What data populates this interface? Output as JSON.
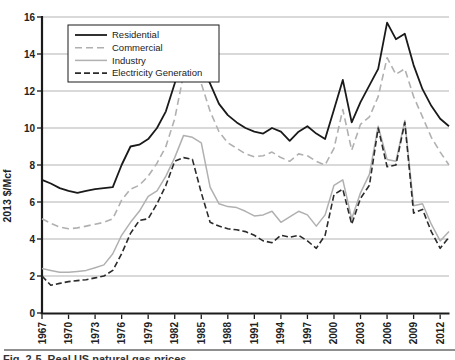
{
  "figure": {
    "caption_partial": "Fig. 2-5. Real US natural gas prices"
  },
  "chart_data": {
    "type": "line",
    "title": "",
    "xlabel": "",
    "ylabel": "2013 $/Mcf",
    "ylim": [
      0,
      16
    ],
    "ytick_step": 2,
    "ytick_values": [
      0,
      2,
      4,
      6,
      8,
      10,
      12,
      14,
      16
    ],
    "x_start": 1967,
    "x_end": 2013,
    "xtick_years": [
      1967,
      1970,
      1973,
      1976,
      1979,
      1982,
      1985,
      1988,
      1991,
      1994,
      1997,
      2000,
      2003,
      2006,
      2009,
      2012
    ],
    "grid": "horizontal-only",
    "gridline_color": "#b3b3b3",
    "axis_color": "#1a1a1a",
    "legend_position": "top-left",
    "years": [
      1967,
      1968,
      1969,
      1970,
      1971,
      1972,
      1973,
      1974,
      1975,
      1976,
      1977,
      1978,
      1979,
      1980,
      1981,
      1982,
      1983,
      1984,
      1985,
      1986,
      1987,
      1988,
      1989,
      1990,
      1991,
      1992,
      1993,
      1994,
      1995,
      1996,
      1997,
      1998,
      1999,
      2000,
      2001,
      2002,
      2003,
      2004,
      2005,
      2006,
      2007,
      2008,
      2009,
      2010,
      2011,
      2012,
      2013
    ],
    "series": [
      {
        "name": "Residential",
        "style": "solid",
        "color": "#1a1a1a",
        "width": 1.8,
        "dash": "",
        "values": [
          7.2,
          7.0,
          6.75,
          6.6,
          6.5,
          6.6,
          6.7,
          6.75,
          6.8,
          8.0,
          9.0,
          9.1,
          9.4,
          10.0,
          10.9,
          12.4,
          14.1,
          13.9,
          13.4,
          12.4,
          11.3,
          10.7,
          10.3,
          10.0,
          9.8,
          9.7,
          10.0,
          9.8,
          9.3,
          9.8,
          10.1,
          9.7,
          9.4,
          11.0,
          12.6,
          10.3,
          11.4,
          12.3,
          13.2,
          15.7,
          14.8,
          15.1,
          13.4,
          12.1,
          11.2,
          10.5,
          10.1
        ]
      },
      {
        "name": "Commercial",
        "style": "dashed",
        "color": "#b0b0b0",
        "width": 1.6,
        "dash": "7,4",
        "values": [
          5.1,
          4.85,
          4.65,
          4.55,
          4.6,
          4.7,
          4.8,
          4.9,
          5.1,
          6.1,
          6.7,
          6.9,
          7.4,
          8.1,
          9.0,
          10.5,
          12.9,
          13.0,
          12.4,
          10.9,
          9.8,
          9.2,
          8.9,
          8.6,
          8.45,
          8.5,
          8.7,
          8.4,
          8.2,
          8.6,
          8.5,
          8.2,
          8.0,
          8.9,
          11.0,
          8.8,
          10.2,
          10.6,
          11.7,
          13.8,
          12.9,
          13.2,
          11.7,
          10.6,
          9.5,
          8.7,
          8.0
        ]
      },
      {
        "name": "Industry",
        "style": "solid",
        "color": "#b0b0b0",
        "width": 1.5,
        "dash": "",
        "values": [
          2.4,
          2.3,
          2.2,
          2.2,
          2.25,
          2.3,
          2.45,
          2.6,
          3.2,
          4.2,
          4.9,
          5.5,
          6.3,
          6.6,
          7.4,
          8.4,
          9.6,
          9.5,
          9.2,
          6.8,
          5.9,
          5.75,
          5.7,
          5.5,
          5.25,
          5.3,
          5.5,
          4.9,
          5.2,
          5.5,
          5.3,
          4.7,
          5.3,
          6.9,
          7.2,
          5.1,
          6.5,
          7.5,
          10.1,
          8.3,
          8.2,
          10.4,
          5.8,
          5.9,
          4.8,
          3.9,
          4.4
        ]
      },
      {
        "name": "Electricity Generation",
        "style": "dashed",
        "color": "#2b2b2b",
        "width": 1.6,
        "dash": "6,3",
        "values": [
          2.0,
          1.5,
          1.6,
          1.7,
          1.75,
          1.8,
          1.9,
          2.0,
          2.3,
          3.2,
          4.3,
          5.0,
          5.1,
          5.9,
          6.9,
          8.2,
          8.4,
          8.3,
          6.5,
          4.9,
          4.7,
          4.55,
          4.5,
          4.4,
          4.2,
          3.9,
          3.8,
          4.2,
          4.1,
          4.2,
          3.9,
          3.5,
          4.2,
          6.4,
          6.7,
          4.8,
          6.2,
          6.9,
          10.0,
          7.9,
          8.0,
          10.3,
          5.4,
          5.6,
          4.4,
          3.5,
          4.1
        ]
      }
    ]
  }
}
